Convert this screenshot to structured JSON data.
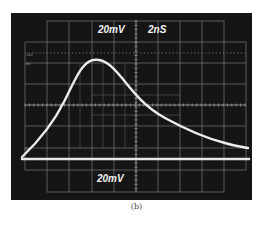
{
  "figure": {
    "caption": "(b)",
    "screen": {
      "background_color": "#151515",
      "grid_color": "#8a8a8a",
      "trace_color": "#e8e8e8"
    },
    "labels": {
      "ch1_scale": "20mV",
      "timebase": "2nS",
      "ch2_scale": "20mV",
      "graticule_100": "100",
      "graticule_90": "90",
      "graticule_10": "10"
    }
  },
  "chart_data": {
    "type": "line",
    "xlabel": "time (2 ns/div)",
    "ylabel": "voltage (20 mV/div)",
    "grid": true,
    "divisions": {
      "x": 10,
      "y": 8
    },
    "series": [
      {
        "name": "pulse",
        "x_div": [
          0.0,
          0.8,
          1.4,
          2.0,
          2.6,
          3.2,
          4.0,
          4.6,
          5.0,
          5.6,
          6.4,
          7.2,
          8.0,
          9.0,
          10.0
        ],
        "y_div": [
          0.1,
          1.4,
          2.5,
          3.8,
          4.6,
          4.6,
          4.2,
          3.6,
          3.0,
          2.5,
          1.9,
          1.5,
          1.1,
          0.8,
          0.5
        ]
      },
      {
        "name": "baseline",
        "x_div": [
          0,
          10
        ],
        "y_div": [
          0,
          0
        ]
      }
    ],
    "annotations": [
      "20mV",
      "2nS",
      "20mV",
      "100",
      "90",
      "10"
    ]
  }
}
